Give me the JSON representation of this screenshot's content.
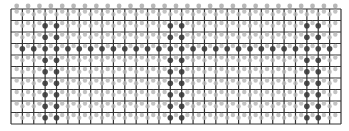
{
  "board": {
    "columns": 29,
    "rows": 10,
    "origin_x": 11,
    "origin_y": 9,
    "width": 330,
    "height": 115,
    "colors": {
      "background": "#ffffff",
      "grid_line": "#333333",
      "peg_light": "#b8b8b8",
      "peg_dark": "#3a3a3a"
    },
    "dark_vertical_lines": [
      3,
      4,
      14,
      15,
      26,
      27
    ],
    "dark_horizontal_rows": [
      3
    ]
  }
}
